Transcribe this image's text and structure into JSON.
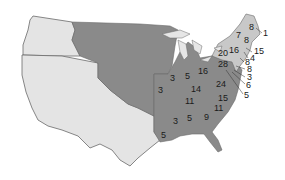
{
  "map": {
    "colors": {
      "territory": "#e4e4e4",
      "states": "#8a8a8a",
      "northeast": "#c8c8c8",
      "border": "#6a6a6a",
      "lakes": "#e6e6e6"
    },
    "labels": [
      {
        "id": "maine",
        "value": "8",
        "x": 249,
        "y": 30
      },
      {
        "id": "maine-extra",
        "value": "1",
        "x": 263,
        "y": 36
      },
      {
        "id": "vermont",
        "value": "7",
        "x": 236,
        "y": 38
      },
      {
        "id": "new-hampshire",
        "value": "8",
        "x": 244,
        "y": 43
      },
      {
        "id": "massachusetts",
        "value": "15",
        "x": 254,
        "y": 54
      },
      {
        "id": "rhode-island",
        "value": "4",
        "x": 250,
        "y": 60
      },
      {
        "id": "connecticut",
        "value": "8",
        "x": 245,
        "y": 64
      },
      {
        "id": "new-york",
        "value": "20",
        "x": 222,
        "y": 55
      },
      {
        "id": "upstate",
        "value": "16",
        "x": 231,
        "y": 52
      },
      {
        "id": "pennsylvania",
        "value": "28",
        "x": 220,
        "y": 66
      },
      {
        "id": "new-jersey",
        "value": "8",
        "x": 247,
        "y": 71
      },
      {
        "id": "delaware",
        "value": "3",
        "x": 247,
        "y": 79
      },
      {
        "id": "maryland",
        "value": "6",
        "x": 247,
        "y": 86
      },
      {
        "id": "dc-area",
        "value": "5",
        "x": 245,
        "y": 97
      },
      {
        "id": "ohio",
        "value": "16",
        "x": 201,
        "y": 73
      },
      {
        "id": "indiana",
        "value": "5",
        "x": 186,
        "y": 78
      },
      {
        "id": "illinois",
        "value": "3",
        "x": 167,
        "y": 80
      },
      {
        "id": "missouri",
        "value": "3",
        "x": 160,
        "y": 92
      },
      {
        "id": "kentucky",
        "value": "14",
        "x": 193,
        "y": 91
      },
      {
        "id": "virginia",
        "value": "24",
        "x": 216,
        "y": 86
      },
      {
        "id": "north-carolina",
        "value": "15",
        "x": 219,
        "y": 100
      },
      {
        "id": "tennessee",
        "value": "11",
        "x": 187,
        "y": 103
      },
      {
        "id": "south-carolina",
        "value": "11",
        "x": 216,
        "y": 110
      },
      {
        "id": "georgia",
        "value": "9",
        "x": 205,
        "y": 118
      },
      {
        "id": "alabama",
        "value": "5",
        "x": 189,
        "y": 120
      },
      {
        "id": "mississippi",
        "value": "3",
        "x": 175,
        "y": 123
      },
      {
        "id": "louisiana",
        "value": "5",
        "x": 162,
        "y": 136
      }
    ]
  }
}
